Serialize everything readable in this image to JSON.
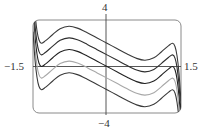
{
  "chart_data": {
    "type": "line",
    "title": "",
    "xlabel": "",
    "ylabel": "",
    "xlim": [
      -1.5,
      1.5
    ],
    "ylim": [
      -4,
      4
    ],
    "grid": false,
    "legend": null,
    "tick_labels": {
      "x_min": "−1.5",
      "x_max": "1.5",
      "y_max": "4",
      "y_min": "−4"
    },
    "base_curve": {
      "description": "odd function, family y = f(x) + C",
      "x": [
        -1.5,
        -1.46,
        -1.42,
        -1.38,
        -1.33,
        -1.25,
        -1.1,
        -0.95,
        -0.77,
        -0.6,
        -0.4,
        -0.2,
        0,
        0.2,
        0.4,
        0.6,
        0.77,
        0.95,
        1.1,
        1.25,
        1.33,
        1.38,
        1.42,
        1.46,
        1.5
      ],
      "y": [
        5.0,
        2.6,
        1.1,
        0.3,
        0.0,
        0.2,
        0.75,
        1.25,
        1.46,
        1.3,
        0.9,
        0.45,
        0,
        -0.45,
        -0.9,
        -1.3,
        -1.46,
        -1.25,
        -0.75,
        -0.2,
        0.0,
        -0.3,
        -1.1,
        -2.6,
        -5.0
      ]
    },
    "series": [
      {
        "name": "C = 2",
        "offset": 2,
        "color": "#3a3a3a"
      },
      {
        "name": "C = 1",
        "offset": 1,
        "color": "#2e2e2e"
      },
      {
        "name": "C = 0",
        "offset": 0,
        "color": "#222222"
      },
      {
        "name": "C = -1",
        "offset": -1,
        "color": "#a8a8a8"
      },
      {
        "name": "C = -2",
        "offset": -2,
        "color": "#3a3a3a"
      }
    ],
    "frame": {
      "color": "#8a8a8a",
      "rounded": true
    }
  }
}
